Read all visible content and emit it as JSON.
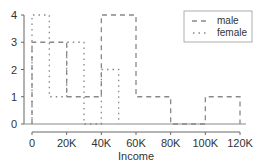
{
  "chart_data": {
    "type": "line",
    "subtype": "step-histogram",
    "title": "",
    "xlabel": "Income",
    "ylabel": "",
    "xlim": [
      0,
      120000
    ],
    "ylim": [
      0,
      4
    ],
    "x_ticks": [
      0,
      20000,
      40000,
      60000,
      80000,
      100000,
      120000
    ],
    "x_tick_labels": [
      "0",
      "20K",
      "40K",
      "60K",
      "80K",
      "100K",
      "120K"
    ],
    "y_ticks": [
      0,
      1,
      2,
      3,
      4
    ],
    "y_tick_labels": [
      "0",
      "1",
      "2",
      "3",
      "4"
    ],
    "grid": false,
    "legend_position": "top-right",
    "series": [
      {
        "name": "male",
        "style": "dashed",
        "color": "#888888",
        "bins": [
          [
            0,
            20000
          ],
          [
            20000,
            40000
          ],
          [
            40000,
            60000
          ],
          [
            60000,
            80000
          ],
          [
            80000,
            100000
          ],
          [
            100000,
            120000
          ]
        ],
        "values": [
          3,
          1,
          4,
          1,
          0,
          1
        ]
      },
      {
        "name": "female",
        "style": "dotted",
        "color": "#888888",
        "bins": [
          [
            0,
            10000
          ],
          [
            10000,
            20000
          ],
          [
            20000,
            30000
          ],
          [
            30000,
            40000
          ],
          [
            40000,
            50000
          ]
        ],
        "values": [
          4,
          1,
          3,
          0,
          2
        ]
      }
    ]
  },
  "legend": {
    "items": [
      {
        "label": "male",
        "style": "dashed"
      },
      {
        "label": "female",
        "style": "dotted"
      }
    ]
  },
  "axis": {
    "xlabel": "Income"
  }
}
